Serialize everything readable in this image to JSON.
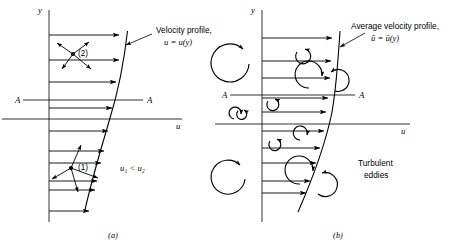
{
  "figure": {
    "background_color": "#ffffff",
    "ink_color": "#000000",
    "panels": [
      {
        "id": "a",
        "caption": "(a)",
        "flow_type": "laminar",
        "y_axis_label": "y",
        "u_axis_label": "u",
        "section_label_left": "A",
        "section_label_right": "A",
        "profile_label_line1": "Velocity profile,",
        "profile_label_line2": "u = u(y)",
        "inequality_label": "u₁ < u₂",
        "point_upper_label": "(2)",
        "point_lower_label": "(1)",
        "arrow_count": 10,
        "description": "Laminar velocity profile with molecular motion at points (1) and (2)"
      },
      {
        "id": "b",
        "caption": "(b)",
        "flow_type": "turbulent",
        "y_axis_label": "y",
        "u_axis_label": "u",
        "section_label_left": "A",
        "section_label_right": "A",
        "profile_label_line1": "Average velocity profile,",
        "profile_label_line2": "ū = ū(y)",
        "eddies_label_line1": "Turbulent",
        "eddies_label_line2": "eddies",
        "arrow_count": 10,
        "eddy_count": 12,
        "description": "Turbulent average velocity profile with turbulent eddies"
      }
    ]
  }
}
